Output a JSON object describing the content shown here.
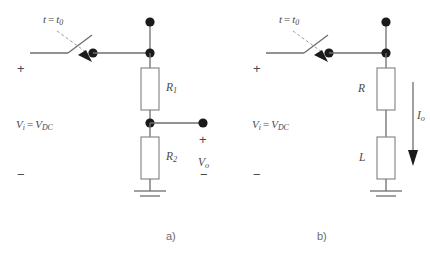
{
  "figure": {
    "background_color": "#ffffff",
    "line_color": "#6e6e6e",
    "node_color": "#1a1a1a",
    "text_color": "#4a4a4a",
    "caption_color": "#6b6b6b"
  },
  "circuit_a": {
    "caption": "a)",
    "switch_label_t": "t",
    "switch_label_eq": "=",
    "switch_label_t0_base": "t",
    "switch_label_t0_sub": "0",
    "source_plus": "+",
    "source_minus": "−",
    "source_label_vi": "V",
    "source_label_vi_sub": "i",
    "source_label_eq": "=",
    "source_label_vdc": "V",
    "source_label_vdc_sub": "DC",
    "component_top_label": "R",
    "component_top_sub": "1",
    "component_bottom_label": "R",
    "component_bottom_sub": "2",
    "output_plus": "+",
    "output_minus": "−",
    "output_label": "V",
    "output_label_sub": "o"
  },
  "circuit_b": {
    "caption": "b)",
    "switch_label_t": "t",
    "switch_label_eq": "=",
    "switch_label_t0_base": "t",
    "switch_label_t0_sub": "0",
    "source_plus": "+",
    "source_minus": "−",
    "source_label_vi": "V",
    "source_label_vi_sub": "i",
    "source_label_eq": "=",
    "source_label_vdc": "V",
    "source_label_vdc_sub": "DC",
    "component_top_label": "R",
    "component_bottom_label": "L",
    "current_label": "I",
    "current_label_sub": "o"
  }
}
